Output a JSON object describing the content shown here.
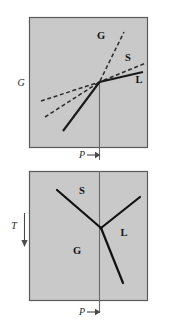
{
  "figure": {
    "title": "",
    "background_color": "#ffffff",
    "panel_fill": "#c9c9c9",
    "panel_border": "#5a5a5a",
    "line_color": "#111111"
  },
  "top_panel": {
    "name": "gibbs-energy-vs-pressure",
    "y_axis_label": "G",
    "x_axis_label": "P",
    "curve_labels": {
      "gas": "G",
      "solid": "S",
      "liquid": "L"
    },
    "curves": [
      {
        "id": "gas",
        "label": "G",
        "style": "dashed",
        "note": "steep dashed line, highest slope"
      },
      {
        "id": "solid",
        "label": "S",
        "style": "dashed",
        "note": "intermediate dashed line"
      },
      {
        "id": "liquid",
        "label": "L",
        "style": "solid",
        "note": "shallow solid line, continues steeply downward-left"
      }
    ]
  },
  "bottom_panel": {
    "name": "temperature-vs-pressure-phase-diagram",
    "y_axis_label": "T",
    "x_axis_label": "P",
    "regions": [
      {
        "id": "solid",
        "label": "S"
      },
      {
        "id": "liquid",
        "label": "L"
      },
      {
        "id": "gas",
        "label": "G"
      }
    ],
    "triple_point": {
      "x": 101,
      "y": 228
    },
    "boundaries": [
      {
        "id": "solid-gas",
        "note": "upper-left branch from triple point"
      },
      {
        "id": "solid-liquid",
        "note": "upper-right branch from triple point"
      },
      {
        "id": "liquid-gas",
        "note": "lower-right branch from triple point"
      }
    ]
  },
  "axis_arrows": {
    "top_pressure": {
      "label": "P",
      "direction": "right"
    },
    "bottom_pressure": {
      "label": "P",
      "direction": "right"
    },
    "temperature": {
      "label": "T",
      "direction": "down"
    }
  }
}
